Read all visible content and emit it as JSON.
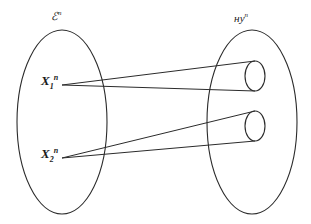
{
  "figure": {
    "type": "set-mapping-diagram",
    "background_color": "#ffffff",
    "stroke_color": "#2b2b2b",
    "text_color": "#1a1a1a"
  },
  "sets": {
    "domain": {
      "label_base": "ℰ",
      "label_sup": "n",
      "label_full": "ℰⁿ",
      "center_x": 62,
      "center_y": 122,
      "radius_x": 45,
      "radius_y": 92
    },
    "codomain": {
      "label_base": "ʜу",
      "label_sup": "n",
      "label_full": "уⁿ",
      "center_x": 252,
      "center_y": 122,
      "radius_x": 45,
      "radius_y": 92
    }
  },
  "points": [
    {
      "name": "x1",
      "label_base": "X",
      "label_sub": "1",
      "label_sup": "n",
      "label_full": "X₁ⁿ",
      "x": 62,
      "y": 85
    },
    {
      "name": "x2",
      "label_base": "X",
      "label_sub": "2",
      "label_sup": "n",
      "label_full": "X₂ⁿ",
      "x": 62,
      "y": 158
    }
  ],
  "cones": [
    {
      "name": "cone-upper",
      "apex_x": 62,
      "apex_y": 85,
      "cap_center_x": 255,
      "cap_center_y": 76,
      "cap_radius_x": 10,
      "cap_radius_y": 15,
      "source_point": "x1"
    },
    {
      "name": "cone-lower",
      "apex_x": 62,
      "apex_y": 158,
      "cap_center_x": 255,
      "cap_center_y": 126,
      "cap_radius_x": 10,
      "cap_radius_y": 15,
      "source_point": "x2"
    }
  ]
}
